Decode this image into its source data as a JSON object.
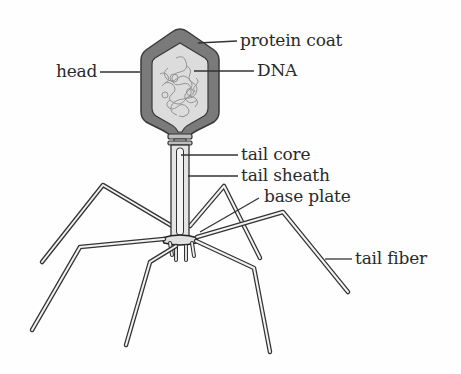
{
  "diagram": {
    "labels": {
      "protein_coat": "protein coat",
      "dna": "DNA",
      "head": "head",
      "tail_core": "tail core",
      "tail_sheath": "tail sheath",
      "base_plate": "base plate",
      "tail_fiber": "tail fiber"
    },
    "colors": {
      "capsid_outer": "#7a7a7a",
      "capsid_inner": "#dcdcdc",
      "dna_strand": "#8c8c8c",
      "outline": "#333333",
      "tail_fill": "#e4e4e4",
      "label_text": "#2a2a2a",
      "leader_line": "#333333"
    }
  }
}
